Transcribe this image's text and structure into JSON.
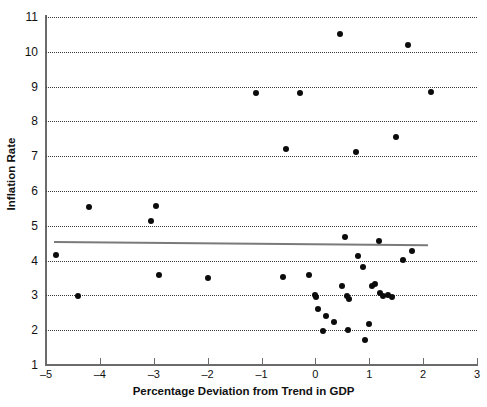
{
  "chart_data": {
    "type": "scatter",
    "title": "",
    "xlabel": "Percentage Deviation from Trend in GDP",
    "ylabel": "Inflation Rate",
    "xlim": [
      -5,
      3
    ],
    "ylim": [
      1,
      11
    ],
    "xticks": [
      -5,
      -4,
      -3,
      -2,
      -1,
      0,
      1,
      2,
      3
    ],
    "xticklabels": [
      "–5",
      "–4",
      "–3",
      "–2",
      "–1",
      "0",
      "1",
      "2",
      "3"
    ],
    "yticks": [
      1,
      2,
      3,
      4,
      5,
      6,
      7,
      8,
      9,
      10,
      11
    ],
    "yticklabels": [
      "1",
      "2",
      "3",
      "4",
      "5",
      "6",
      "7",
      "8",
      "9",
      "10",
      "11"
    ],
    "grid": "horizontal-dotted",
    "legend": "none",
    "marker": {
      "shape": "circle",
      "color": "#0b0b0b",
      "size": 6
    },
    "points": [
      {
        "x": -4.82,
        "y": 4.17
      },
      {
        "x": -4.4,
        "y": 2.98
      },
      {
        "x": -4.2,
        "y": 5.55
      },
      {
        "x": -3.05,
        "y": 5.15
      },
      {
        "x": -2.95,
        "y": 5.57
      },
      {
        "x": -2.9,
        "y": 3.58
      },
      {
        "x": -2.0,
        "y": 3.5
      },
      {
        "x": -1.1,
        "y": 8.82
      },
      {
        "x": -0.6,
        "y": 3.52
      },
      {
        "x": -0.55,
        "y": 7.22
      },
      {
        "x": -0.28,
        "y": 8.82
      },
      {
        "x": -0.12,
        "y": 3.58
      },
      {
        "x": 0.0,
        "y": 3.02
      },
      {
        "x": 0.02,
        "y": 2.95
      },
      {
        "x": 0.05,
        "y": 2.62
      },
      {
        "x": 0.15,
        "y": 1.98
      },
      {
        "x": 0.2,
        "y": 2.4
      },
      {
        "x": 0.35,
        "y": 2.25
      },
      {
        "x": 0.45,
        "y": 10.5
      },
      {
        "x": 0.5,
        "y": 3.28
      },
      {
        "x": 0.55,
        "y": 4.68
      },
      {
        "x": 0.58,
        "y": 2.97
      },
      {
        "x": 0.6,
        "y": 2.02
      },
      {
        "x": 0.62,
        "y": 2.9
      },
      {
        "x": 0.75,
        "y": 7.12
      },
      {
        "x": 0.8,
        "y": 4.12
      },
      {
        "x": 0.88,
        "y": 3.82
      },
      {
        "x": 0.92,
        "y": 1.72
      },
      {
        "x": 1.0,
        "y": 2.18
      },
      {
        "x": 1.05,
        "y": 3.28
      },
      {
        "x": 1.1,
        "y": 3.32
      },
      {
        "x": 1.18,
        "y": 4.55
      },
      {
        "x": 1.2,
        "y": 3.08
      },
      {
        "x": 1.25,
        "y": 2.98
      },
      {
        "x": 1.35,
        "y": 3.02
      },
      {
        "x": 1.42,
        "y": 2.95
      },
      {
        "x": 1.5,
        "y": 7.55
      },
      {
        "x": 1.62,
        "y": 4.02
      },
      {
        "x": 1.72,
        "y": 10.2
      },
      {
        "x": 1.8,
        "y": 4.28
      },
      {
        "x": 2.15,
        "y": 8.85
      }
    ],
    "trendline": {
      "x1": -4.85,
      "y1": 4.57,
      "x2": 2.1,
      "y2": 4.48,
      "color": "#7a7a7a",
      "width": 2
    }
  }
}
